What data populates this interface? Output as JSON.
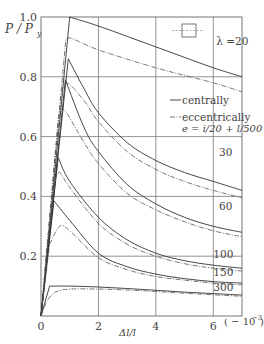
{
  "chart_data": {
    "type": "line",
    "title": "",
    "xlabel": "Δl/l",
    "xunit": "(−10⁻³)",
    "ylabel": "P / P_y",
    "xlim": [
      0,
      7
    ],
    "ylim": [
      0,
      1.0
    ],
    "x_ticks": [
      "0",
      "2",
      "4",
      "6"
    ],
    "y_ticks": [
      "0.2",
      "0.4",
      "0.6",
      "0.8",
      "1.0"
    ],
    "grid": true,
    "legend": {
      "position": "upper right (inside plot)",
      "entries": [
        {
          "label": "centrally",
          "style": "solid"
        },
        {
          "label": "eccentrically",
          "style": "dash-dot"
        }
      ],
      "note": "e = i/20 + l/500",
      "section_icon": "square-cross-section"
    },
    "series": [
      {
        "name": "λ=20 centrally",
        "lambda": 20,
        "style": "solid",
        "x": [
          0,
          1.0,
          2,
          3,
          4,
          5,
          6,
          7
        ],
        "y": [
          0,
          1.0,
          0.97,
          0.935,
          0.9,
          0.865,
          0.83,
          0.8
        ]
      },
      {
        "name": "λ=20 eccentrically",
        "lambda": 20,
        "style": "dash-dot",
        "x": [
          0,
          0.85,
          1.0,
          2,
          4,
          6,
          7
        ],
        "y": [
          0,
          0.91,
          0.93,
          0.89,
          0.83,
          0.78,
          0.75
        ]
      },
      {
        "name": "λ=30 centrally",
        "lambda": 30,
        "style": "solid",
        "x": [
          0,
          0.95,
          1.5,
          2,
          3,
          4,
          5,
          6,
          7
        ],
        "y": [
          0,
          0.86,
          0.76,
          0.68,
          0.58,
          0.52,
          0.48,
          0.45,
          0.42
        ]
      },
      {
        "name": "λ=30 eccentrically",
        "lambda": 30,
        "style": "dash-dot",
        "x": [
          0,
          0.7,
          0.9,
          1.5,
          2,
          3,
          4,
          5,
          6,
          7
        ],
        "y": [
          0,
          0.74,
          0.78,
          0.72,
          0.65,
          0.55,
          0.49,
          0.45,
          0.42,
          0.395
        ]
      },
      {
        "name": "λ=60 centrally",
        "lambda": 60,
        "style": "solid",
        "x": [
          0,
          0.85,
          1.5,
          2,
          3,
          4,
          5,
          6,
          7
        ],
        "y": [
          0,
          0.79,
          0.63,
          0.55,
          0.44,
          0.375,
          0.33,
          0.3,
          0.28
        ]
      },
      {
        "name": "λ=60 eccentrically",
        "lambda": 60,
        "style": "dash-dot",
        "x": [
          0,
          0.6,
          0.8,
          1.5,
          2,
          3,
          4,
          5,
          6,
          7
        ],
        "y": [
          0,
          0.66,
          0.69,
          0.58,
          0.51,
          0.41,
          0.355,
          0.315,
          0.285,
          0.265
        ]
      },
      {
        "name": "λ=100 centrally",
        "lambda": 100,
        "style": "solid",
        "x": [
          0,
          0.6,
          1.0,
          2,
          3,
          4,
          5,
          6,
          7
        ],
        "y": [
          0,
          0.53,
          0.45,
          0.33,
          0.255,
          0.21,
          0.185,
          0.17,
          0.16
        ]
      },
      {
        "name": "λ=100 eccentrically",
        "lambda": 100,
        "style": "dash-dot",
        "x": [
          0,
          0.5,
          0.65,
          1.0,
          2,
          3,
          4,
          5,
          6,
          7
        ],
        "y": [
          0,
          0.46,
          0.48,
          0.43,
          0.31,
          0.24,
          0.2,
          0.175,
          0.16,
          0.15
        ]
      },
      {
        "name": "λ=150 centrally",
        "lambda": 150,
        "style": "solid",
        "x": [
          0,
          0.45,
          1.0,
          2,
          3,
          4,
          5,
          6,
          7
        ],
        "y": [
          0,
          0.385,
          0.32,
          0.21,
          0.165,
          0.14,
          0.125,
          0.115,
          0.11
        ]
      },
      {
        "name": "λ=150 eccentrically",
        "lambda": 150,
        "style": "dash-dot",
        "x": [
          0,
          0.3,
          0.65,
          1.0,
          2,
          3,
          4,
          5,
          6,
          7
        ],
        "y": [
          0,
          0.24,
          0.3,
          0.285,
          0.195,
          0.155,
          0.132,
          0.12,
          0.11,
          0.104
        ]
      },
      {
        "name": "λ=300 centrally",
        "lambda": 300,
        "style": "solid",
        "x": [
          0,
          0.3,
          1.0,
          2,
          3,
          4,
          5,
          6,
          7
        ],
        "y": [
          0,
          0.1,
          0.1,
          0.097,
          0.092,
          0.086,
          0.08,
          0.075,
          0.07
        ]
      },
      {
        "name": "λ=300 eccentrically",
        "lambda": 300,
        "style": "dash-dot",
        "x": [
          0,
          0.2,
          0.5,
          1.0,
          2,
          3,
          4,
          5,
          6,
          7
        ],
        "y": [
          0,
          0.05,
          0.08,
          0.09,
          0.09,
          0.087,
          0.082,
          0.076,
          0.071,
          0.066
        ]
      }
    ],
    "annotations": [
      {
        "text": "λ =20",
        "x": 6.1,
        "y": 0.905
      },
      {
        "text": "30",
        "x": 6.2,
        "y": 0.535
      },
      {
        "text": "60",
        "x": 6.2,
        "y": 0.355
      },
      {
        "text": "100",
        "x": 6.0,
        "y": 0.195
      },
      {
        "text": "150",
        "x": 6.0,
        "y": 0.135
      },
      {
        "text": "300",
        "x": 6.0,
        "y": 0.085
      }
    ]
  }
}
